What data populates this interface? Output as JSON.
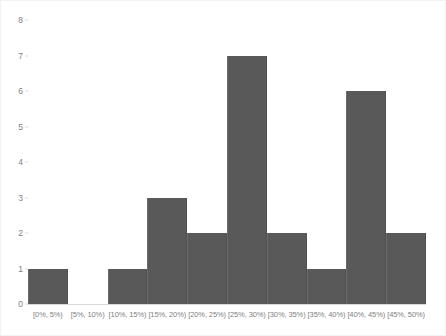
{
  "chart_data": {
    "type": "bar",
    "title": "",
    "subtitle": "",
    "xlabel": "",
    "ylabel": "",
    "categories": [
      "[0%, 5%)",
      "[5%, 10%)",
      "[10%, 15%)",
      "[15%, 20%)",
      "[20%, 25%)",
      "[25%, 30%)",
      "[30%, 35%)",
      "[35%, 40%)",
      "[40%, 45%)",
      "[45%, 50%)"
    ],
    "values": [
      1,
      0,
      1,
      3,
      2,
      7,
      2,
      1,
      6,
      2
    ],
    "ylim": [
      0,
      8
    ],
    "yticks": [
      0,
      1,
      2,
      3,
      4,
      5,
      6,
      7,
      8
    ],
    "ytick_labels": [
      "0",
      "1",
      "2",
      "3",
      "4",
      "5",
      "6",
      "7",
      "8"
    ],
    "grid": false,
    "legend": null,
    "legend_position": "none",
    "bar_color": "#595959",
    "axis_color": "#d9d9d9",
    "tick_label_color": "#7f7f7f",
    "frame_color": "#f2f2f2",
    "background": "#ffffff",
    "annotations": []
  }
}
